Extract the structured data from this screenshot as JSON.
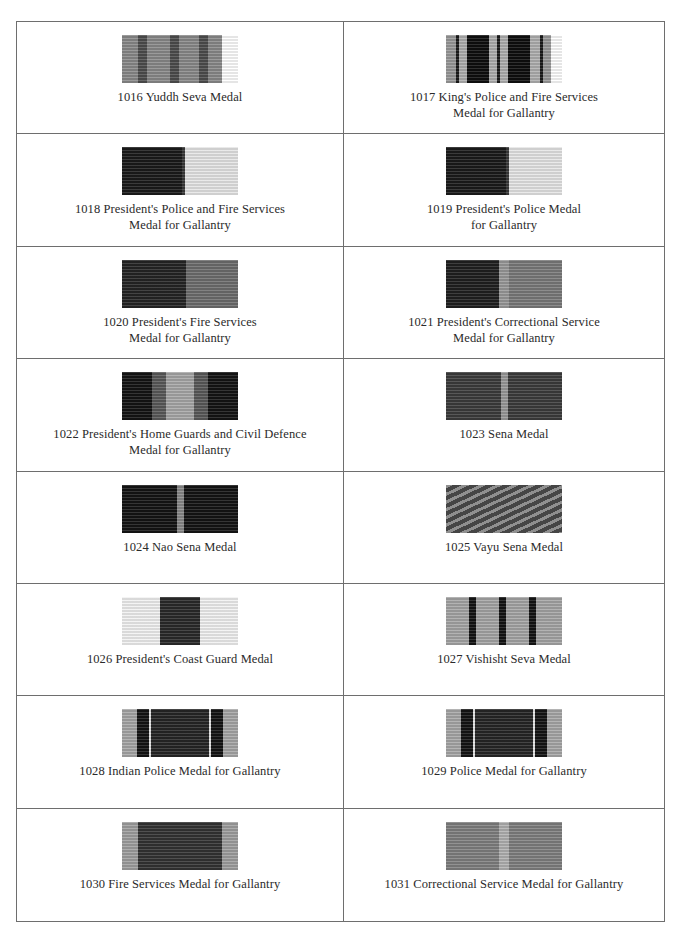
{
  "page": {
    "medals": [
      {
        "number": "1016",
        "caption": "1016 Yuddh Seva Medal",
        "stripes": [
          [
            "#8a8a8a",
            16
          ],
          [
            "#4e4e4e",
            9
          ],
          [
            "#8a8a8a",
            23
          ],
          [
            "#4e4e4e",
            9
          ],
          [
            "#8a8a8a",
            20
          ],
          [
            "#4e4e4e",
            9
          ],
          [
            "#8a8a8a",
            14
          ]
        ]
      },
      {
        "number": "1017",
        "caption": "1017 King's Police and Fire Services\nMedal for Gallantry",
        "stripes": [
          [
            "#9a9a9a",
            10
          ],
          [
            "#1a1a1a",
            3
          ],
          [
            "#b0b0b0",
            8
          ],
          [
            "#0e0e0e",
            22
          ],
          [
            "#b0b0b0",
            8
          ],
          [
            "#1a1a1a",
            3
          ],
          [
            "#b0b0b0",
            8
          ],
          [
            "#0e0e0e",
            22
          ],
          [
            "#b0b0b0",
            10
          ],
          [
            "#1a1a1a",
            3
          ],
          [
            "#9a9a9a",
            8
          ]
        ]
      },
      {
        "number": "1018",
        "caption": "1018 President's Police and Fire Services\nMedal for Gallantry",
        "stripes": [
          [
            "#1b1b1b",
            60
          ],
          [
            "#3a3a3a",
            3
          ],
          [
            "#e6e6e6",
            53
          ]
        ]
      },
      {
        "number": "1019",
        "caption": "1019 President's Police Medal\nfor Gallantry",
        "stripes": [
          [
            "#1b1b1b",
            60
          ],
          [
            "#3a3a3a",
            3
          ],
          [
            "#e6e6e6",
            53
          ]
        ]
      },
      {
        "number": "1020",
        "caption": "1020 President's Fire Services\nMedal for Gallantry",
        "stripes": [
          [
            "#252525",
            64
          ],
          [
            "#6e6e6e",
            52
          ]
        ]
      },
      {
        "number": "1021",
        "caption": "1021 President's Correctional Service\nMedal for Gallantry",
        "stripes": [
          [
            "#202020",
            53
          ],
          [
            "#9a9a9a",
            10
          ],
          [
            "#7a7a7a",
            53
          ]
        ]
      },
      {
        "number": "1022",
        "caption": "1022 President's Home Guards and Civil Defence\nMedal for Gallantry",
        "stripes": [
          [
            "#141414",
            30
          ],
          [
            "#5a5a5a",
            14
          ],
          [
            "#a8a8a8",
            28
          ],
          [
            "#5a5a5a",
            14
          ],
          [
            "#141414",
            30
          ]
        ]
      },
      {
        "number": "1023",
        "caption": "1023 Sena Medal",
        "stripes": [
          [
            "#3c3c3c",
            55
          ],
          [
            "#9a9a9a",
            7
          ],
          [
            "#3c3c3c",
            54
          ]
        ]
      },
      {
        "number": "1024",
        "caption": "1024 Nao Sena Medal",
        "stripes": [
          [
            "#141414",
            55
          ],
          [
            "#8a8a8a",
            7
          ],
          [
            "#141414",
            54
          ]
        ]
      },
      {
        "number": "1025",
        "caption": "1025 Vayu Sena Medal",
        "stripes": [
          [
            "#6a6a6a",
            116
          ]
        ],
        "diagonal": true
      },
      {
        "number": "1026",
        "caption": "1026 President's Coast Guard Medal",
        "stripes": [
          [
            "#f2f2f2",
            38
          ],
          [
            "#2a2a2a",
            40
          ],
          [
            "#f2f2f2",
            38
          ]
        ]
      },
      {
        "number": "1027",
        "caption": "1027 Vishisht Seva Medal",
        "stripes": [
          [
            "#a6a6a6",
            23
          ],
          [
            "#141414",
            7
          ],
          [
            "#a6a6a6",
            23
          ],
          [
            "#141414",
            7
          ],
          [
            "#a6a6a6",
            23
          ],
          [
            "#141414",
            7
          ],
          [
            "#a6a6a6",
            26
          ]
        ]
      },
      {
        "number": "1028",
        "caption": "1028 Indian Police Medal for Gallantry",
        "stripes": [
          [
            "#a8a8a8",
            15
          ],
          [
            "#141414",
            12
          ],
          [
            "#e8e8e8",
            2
          ],
          [
            "#262626",
            58
          ],
          [
            "#e8e8e8",
            2
          ],
          [
            "#141414",
            12
          ],
          [
            "#a8a8a8",
            15
          ]
        ]
      },
      {
        "number": "1029",
        "caption": "1029 Police Medal for Gallantry",
        "stripes": [
          [
            "#a8a8a8",
            15
          ],
          [
            "#141414",
            12
          ],
          [
            "#e8e8e8",
            2
          ],
          [
            "#262626",
            58
          ],
          [
            "#e8e8e8",
            2
          ],
          [
            "#141414",
            12
          ],
          [
            "#a8a8a8",
            15
          ]
        ]
      },
      {
        "number": "1030",
        "caption": "1030 Fire Services Medal for Gallantry",
        "stripes": [
          [
            "#a0a0a0",
            16
          ],
          [
            "#333333",
            84
          ],
          [
            "#a0a0a0",
            16
          ]
        ]
      },
      {
        "number": "1031",
        "caption": "1031 Correctional Service Medal for Gallantry",
        "stripes": [
          [
            "#808080",
            53
          ],
          [
            "#b2b2b2",
            10
          ],
          [
            "#808080",
            53
          ]
        ]
      }
    ]
  }
}
